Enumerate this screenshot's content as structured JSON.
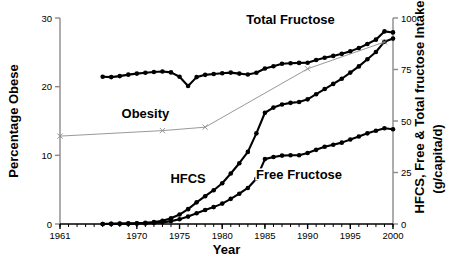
{
  "chart_data": {
    "type": "line",
    "title": "",
    "xlabel": "Year",
    "ylabel_left": "Percentage Obese",
    "ylabel_right": "HFCS, Free & Total fructose Intake",
    "ylabel_right_units": "(g/capita/d)",
    "xlim": [
      1961,
      2000
    ],
    "ylim_left": [
      0,
      30
    ],
    "ylim_right": [
      0,
      100
    ],
    "xticks": [
      1961,
      1970,
      1975,
      1980,
      1985,
      1990,
      1995,
      2000
    ],
    "xtick_labels": [
      "1961",
      "1970",
      "1975",
      "1980",
      "1985",
      "1990",
      "1995",
      "2000"
    ],
    "yticks_left": [
      0,
      10,
      20,
      30
    ],
    "ytick_labels_left": [
      "0",
      "10",
      "20",
      "30"
    ],
    "yticks_right": [
      0,
      25,
      50,
      75,
      100
    ],
    "ytick_labels_right": [
      "0",
      "25",
      "50",
      "75",
      "100"
    ],
    "minor_xticks": true,
    "grid": false,
    "legend_position": "inline-annotations",
    "series": [
      {
        "name": "Total Fructose",
        "axis": "right",
        "units": "g/capita/d",
        "color": "#000000",
        "marker": "filled-circle",
        "label_x": 1988,
        "label_y": 97,
        "x": [
          1966,
          1967,
          1968,
          1969,
          1970,
          1971,
          1972,
          1973,
          1974,
          1975,
          1976,
          1977,
          1978,
          1979,
          1980,
          1981,
          1982,
          1983,
          1984,
          1985,
          1986,
          1987,
          1988,
          1989,
          1990,
          1991,
          1992,
          1993,
          1994,
          1995,
          1996,
          1997,
          1998,
          1999,
          2000
        ],
        "y": [
          71.5,
          71.3,
          71.8,
          72.5,
          73.0,
          73.4,
          73.8,
          74.0,
          73.6,
          71.5,
          67.0,
          71.3,
          72.4,
          72.8,
          73.2,
          73.5,
          73.0,
          72.6,
          73.4,
          75.5,
          76.6,
          77.8,
          78.0,
          78.2,
          78.3,
          79.6,
          80.7,
          81.6,
          82.6,
          83.8,
          85.4,
          87.4,
          89.5,
          93.5,
          93.0
        ]
      },
      {
        "name": "HFCS",
        "axis": "right",
        "units": "g/capita/d",
        "color": "#000000",
        "marker": "filled-circle",
        "label_x": 1976,
        "label_y": 20,
        "x": [
          1966,
          1967,
          1968,
          1969,
          1970,
          1971,
          1972,
          1973,
          1974,
          1975,
          1976,
          1977,
          1978,
          1979,
          1980,
          1981,
          1982,
          1983,
          1984,
          1985,
          1986,
          1987,
          1988,
          1989,
          1990,
          1991,
          1992,
          1993,
          1994,
          1995,
          1996,
          1997,
          1998,
          1999,
          2000
        ],
        "y": [
          0.0,
          0.1,
          0.2,
          0.3,
          0.4,
          0.6,
          1.0,
          1.6,
          2.8,
          4.6,
          7.2,
          10.5,
          13.5,
          16.4,
          19.8,
          24.5,
          29.5,
          35.0,
          44.0,
          54.0,
          56.5,
          58.0,
          58.8,
          59.2,
          60.5,
          63.0,
          65.5,
          68.0,
          70.5,
          73.5,
          76.5,
          80.0,
          83.5,
          88.5,
          90.0
        ]
      },
      {
        "name": "Free Fructose",
        "axis": "right",
        "units": "g/capita/d",
        "color": "#000000",
        "marker": "filled-circle",
        "label_x": 1989,
        "label_y": 22,
        "x": [
          1966,
          1967,
          1968,
          1969,
          1970,
          1971,
          1972,
          1973,
          1974,
          1975,
          1976,
          1977,
          1978,
          1979,
          1980,
          1981,
          1982,
          1983,
          1984,
          1985,
          1986,
          1987,
          1988,
          1989,
          1990,
          1991,
          1992,
          1993,
          1994,
          1995,
          1996,
          1997,
          1998,
          1999,
          2000
        ],
        "y": [
          0.0,
          0.05,
          0.1,
          0.15,
          0.2,
          0.3,
          0.5,
          0.8,
          1.4,
          2.3,
          3.6,
          5.2,
          6.8,
          8.2,
          9.9,
          12.2,
          14.7,
          17.5,
          22.0,
          31.5,
          32.5,
          33.2,
          33.4,
          33.4,
          34.5,
          36.0,
          37.5,
          38.5,
          39.5,
          41.0,
          42.5,
          44.0,
          45.3,
          46.5,
          46.0
        ]
      },
      {
        "name": "Obesity",
        "axis": "left",
        "units": "percent",
        "color": "#8c8c8c",
        "marker": "x-cross",
        "label_x": 1971,
        "label_y": 15.5,
        "x": [
          1961,
          1973,
          1978,
          1990,
          1999
        ],
        "y": [
          12.8,
          13.6,
          14.1,
          22.6,
          26.5
        ]
      }
    ]
  }
}
